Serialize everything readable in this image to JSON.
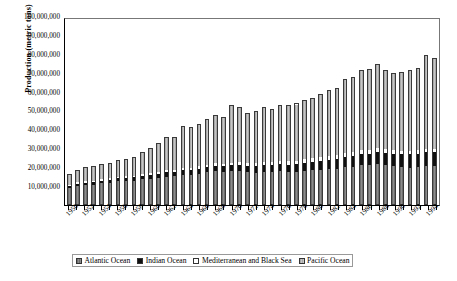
{
  "chart_data": {
    "type": "bar",
    "stacked": true,
    "title": "",
    "xlabel": "",
    "ylabel": "Production (metric tons)",
    "ylim": [
      0,
      100000000
    ],
    "ytick_labels": [
      "100,000,000",
      "90,000,000",
      "80,000,000",
      "70,000,000",
      "60,000,000",
      "50,000,000",
      "40,000,000",
      "30,000,000",
      "20,000,000",
      "10,000,000"
    ],
    "ytick_values": [
      100000000,
      90000000,
      80000000,
      70000000,
      60000000,
      50000000,
      40000000,
      30000000,
      20000000,
      10000000
    ],
    "grid": false,
    "legend_position": "bottom",
    "categories": [
      "1950",
      "1951",
      "1952",
      "1953",
      "1954",
      "1955",
      "1956",
      "1957",
      "1958",
      "1959",
      "1960",
      "1961",
      "1962",
      "1963",
      "1964",
      "1965",
      "1966",
      "1967",
      "1968",
      "1969",
      "1970",
      "1971",
      "1972",
      "1973",
      "1974",
      "1975",
      "1976",
      "1977",
      "1978",
      "1979",
      "1980",
      "1981",
      "1982",
      "1983",
      "1984",
      "1985",
      "1986",
      "1987",
      "1988",
      "1989",
      "1990",
      "1991",
      "1992",
      "1993",
      "1994",
      "1995"
    ],
    "tick_label_every": 2,
    "visible_tick_labels": [
      "1950",
      "1952",
      "1954",
      "1956",
      "1958",
      "1960",
      "1962",
      "1964",
      "1966",
      "1968",
      "1970",
      "1972",
      "1974",
      "1976",
      "1978",
      "1980",
      "1982",
      "1984",
      "1986",
      "1988",
      "1990",
      "1992",
      "1994"
    ],
    "series": [
      {
        "name": "Atlantic Ocean",
        "color": "#808080",
        "values": [
          9200000,
          10300000,
          10600000,
          10800000,
          11600000,
          12000000,
          12600000,
          12700000,
          12900000,
          13600000,
          13900000,
          14400000,
          15000000,
          15100000,
          15900000,
          16000000,
          16600000,
          17200000,
          17900000,
          17600000,
          17900000,
          18000000,
          17400000,
          17000000,
          17600000,
          17400000,
          17800000,
          17400000,
          17600000,
          18000000,
          18400000,
          18600000,
          19000000,
          19200000,
          20000000,
          20200000,
          21000000,
          21200000,
          21600000,
          21000000,
          20400000,
          20000000,
          19600000,
          19800000,
          20600000,
          20400000
        ]
      },
      {
        "name": "Indian Ocean",
        "color": "#101010",
        "values": [
          1100000,
          1200000,
          1300000,
          1400000,
          1500000,
          1600000,
          1700000,
          1800000,
          1900000,
          2000000,
          2100000,
          2200000,
          2300000,
          2400000,
          2500000,
          2600000,
          2700000,
          2800000,
          2900000,
          3000000,
          3100000,
          3200000,
          3300000,
          3400000,
          3500000,
          3600000,
          3800000,
          3900000,
          4100000,
          4200000,
          4400000,
          4600000,
          4800000,
          5000000,
          5300000,
          5500000,
          5800000,
          6000000,
          6300000,
          6500000,
          6800000,
          7000000,
          7200000,
          7400000,
          7600000,
          7800000
        ]
      },
      {
        "name": "Mediterranean and Black Sea",
        "color": "#ffffff",
        "values": [
          700000,
          750000,
          800000,
          820000,
          850000,
          880000,
          900000,
          920000,
          950000,
          980000,
          1000000,
          1050000,
          1100000,
          1150000,
          1200000,
          1250000,
          1300000,
          1350000,
          1400000,
          1450000,
          1500000,
          1550000,
          1600000,
          1650000,
          1700000,
          1750000,
          1800000,
          1850000,
          1900000,
          1950000,
          2000000,
          2050000,
          2100000,
          2150000,
          2200000,
          2250000,
          2300000,
          2200000,
          2100000,
          2000000,
          1900000,
          1800000,
          1750000,
          1700000,
          1650000,
          1600000
        ]
      },
      {
        "name": "Pacific Ocean",
        "color": "#b8b8b8",
        "values": [
          5600000,
          6450000,
          7600000,
          7680000,
          7750000,
          8020000,
          8800000,
          9180000,
          9850000,
          11840000,
          13500000,
          15550000,
          17900000,
          17650000,
          22400000,
          21450000,
          22400000,
          24650000,
          25800000,
          24950000,
          30500000,
          29250000,
          26700000,
          27950000,
          29200000,
          28250000,
          29600000,
          29850000,
          30400000,
          31850000,
          32200000,
          33750000,
          35100000,
          35650000,
          39500000,
          40050000,
          42900000,
          42750000,
          45000000,
          42500000,
          40900000,
          42200000,
          43450000,
          44100000,
          50150000,
          48200000
        ]
      }
    ]
  },
  "legend": {
    "items": [
      {
        "label": "Atlantic Ocean",
        "swatch": "atlantic"
      },
      {
        "label": "Indian Ocean",
        "swatch": "indian"
      },
      {
        "label": "Mediterranean and Black Sea",
        "swatch": "medit"
      },
      {
        "label": "Pacific Ocean",
        "swatch": "pacific"
      }
    ]
  }
}
